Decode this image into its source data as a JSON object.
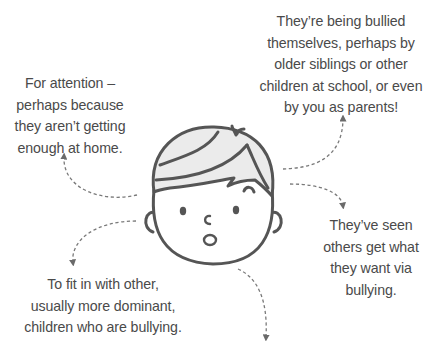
{
  "diagram": {
    "type": "reasons-mind-map",
    "center_illustration": "child-face-with-surprised-expression",
    "colors": {
      "text": "#4a4a4a",
      "line": "#555555",
      "hair_fill": "#ebebeb",
      "arrow": "#6a6a6a",
      "background": "#ffffff"
    },
    "captions": {
      "top_right": {
        "lines": [
          "They’re being bullied",
          "themselves, perhaps by",
          "older siblings or other",
          "children at school, or even",
          "by you as parents!"
        ]
      },
      "left": {
        "lines": [
          "For attention –",
          "perhaps because",
          "they aren’t getting",
          "enough at home."
        ]
      },
      "right": {
        "lines": [
          "They’ve seen",
          "others get what",
          "they want via",
          "bullying."
        ]
      },
      "bottom_left": {
        "lines": [
          "To fit in with other,",
          "usually more dominant,",
          "children who are bullying."
        ]
      }
    },
    "arrows": [
      {
        "from": "face",
        "to": "top_right",
        "direction": "up"
      },
      {
        "from": "face",
        "to": "left",
        "direction": "up"
      },
      {
        "from": "face",
        "to": "right",
        "direction": "down"
      },
      {
        "from": "face",
        "to": "bottom_left",
        "direction": "down"
      },
      {
        "from": "face",
        "to": "bottom_offscreen",
        "direction": "down"
      }
    ]
  }
}
